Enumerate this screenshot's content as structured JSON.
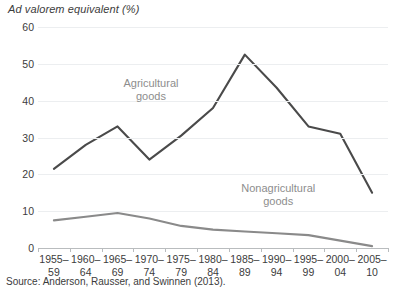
{
  "chart_data": {
    "type": "line",
    "title": "Ad valorem equivalent (%)",
    "xlabel": "",
    "ylabel": "Ad valorem equivalent (%)",
    "ylim": [
      0,
      60
    ],
    "yticks": [
      0,
      10,
      20,
      30,
      40,
      50,
      60
    ],
    "grid": true,
    "legend_position": "inline-annotation",
    "categories": [
      "1955–59",
      "1960–64",
      "1965–69",
      "1970–74",
      "1975–79",
      "1980–84",
      "1985–89",
      "1990–94",
      "1995–99",
      "2000–04",
      "2005–10"
    ],
    "category_lines": [
      [
        "1955–",
        "59"
      ],
      [
        "1960–",
        "64"
      ],
      [
        "1965–",
        "69"
      ],
      [
        "1970–",
        "74"
      ],
      [
        "1975–",
        "79"
      ],
      [
        "1980–",
        "84"
      ],
      [
        "1985–",
        "89"
      ],
      [
        "1990–",
        "94"
      ],
      [
        "1995–",
        "99"
      ],
      [
        "2000–",
        "04"
      ],
      [
        "2005–",
        "10"
      ]
    ],
    "series": [
      {
        "name": "Agricultural goods",
        "color": "#4a4a4a",
        "values": [
          21.5,
          28.0,
          33.0,
          24.0,
          30.5,
          38.0,
          52.5,
          43.5,
          33.0,
          31.0,
          15.0
        ],
        "label_lines": [
          "Agricultural",
          "goods"
        ],
        "label_x_index": 3.05,
        "label_y_value": 46.5
      },
      {
        "name": "Nonagricultural goods",
        "color": "#8a8a8a",
        "values": [
          7.5,
          8.5,
          9.5,
          8.0,
          6.0,
          5.0,
          4.5,
          4.0,
          3.5,
          2.0,
          0.5
        ],
        "label_lines": [
          "Nonagricultural",
          "goods"
        ],
        "label_x_index": 7.05,
        "label_y_value": 18.0
      }
    ],
    "source": "Source: Anderson, Rausser, and Swinnen (2013)."
  }
}
